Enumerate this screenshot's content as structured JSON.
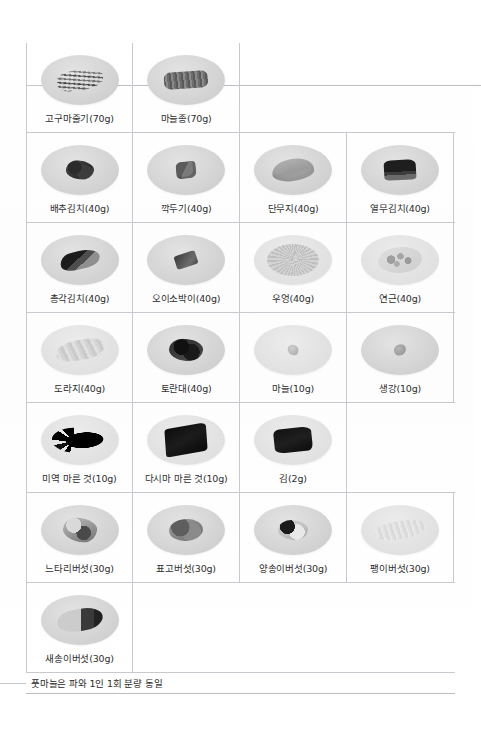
{
  "document": {
    "type": "scanned-reference-table",
    "title_visible": false,
    "footnote": "풋마늘은 파와 1인 1회 분량 동일"
  },
  "table": {
    "columns": 4,
    "rows": [
      {
        "index": 0,
        "cells": [
          {
            "label": "고구마줄기(70g)",
            "food": "sweet-potato-stem",
            "shape": "f-stems",
            "plate": "plate"
          },
          {
            "label": "마늘종(70g)",
            "food": "garlic-scape",
            "shape": "f-bundle",
            "plate": "plate"
          },
          {
            "label": "",
            "food": "",
            "shape": "",
            "plate": ""
          },
          {
            "label": "",
            "food": "",
            "shape": "",
            "plate": ""
          }
        ]
      },
      {
        "index": 1,
        "cells": [
          {
            "label": "배추김치(40g)",
            "food": "napa-cabbage-kimchi",
            "shape": "f-kimchi",
            "plate": "plate"
          },
          {
            "label": "깍두기(40g)",
            "food": "radish-cube-kimchi",
            "shape": "f-cubes",
            "plate": "plate"
          },
          {
            "label": "단무지(40g)",
            "food": "pickled-radish",
            "shape": "f-slab",
            "plate": "plate"
          },
          {
            "label": "열무김치(40g)",
            "food": "young-radish-kimchi",
            "shape": "f-dark-stack",
            "plate": "plate"
          }
        ]
      },
      {
        "index": 2,
        "cells": [
          {
            "label": "총각김치(40g)",
            "food": "ponytail-radish-kimchi",
            "shape": "f-radish-kimchi",
            "plate": "plate"
          },
          {
            "label": "오이소박이(40g)",
            "food": "stuffed-cucumber-kimchi",
            "shape": "f-chunk",
            "plate": "plate"
          },
          {
            "label": "우엉(40g)",
            "food": "burdock-root",
            "shape": "f-noodly",
            "plate": "plate pale"
          },
          {
            "label": "연근(40g)",
            "food": "lotus-root",
            "shape": "f-lotus",
            "plate": "plate pale"
          }
        ]
      },
      {
        "index": 3,
        "cells": [
          {
            "label": "도라지(40g)",
            "food": "bellflower-root",
            "shape": "f-roots",
            "plate": "plate pale"
          },
          {
            "label": "토란대(40g)",
            "food": "taro-stem",
            "shape": "f-taro",
            "plate": "plate"
          },
          {
            "label": "마늘(10g)",
            "food": "garlic",
            "shape": "f-tiny",
            "plate": "plate pale"
          },
          {
            "label": "생강(10g)",
            "food": "ginger",
            "shape": "f-tiny-dark",
            "plate": "plate"
          }
        ]
      },
      {
        "index": 4,
        "cells": [
          {
            "label": "미역 마른 것(10g)",
            "food": "dried-sea-mustard",
            "shape": "f-seaweed-dry",
            "plate": "plate pale"
          },
          {
            "label": "다시마 마른 것(10g)",
            "food": "dried-kelp",
            "shape": "f-kelp",
            "plate": "plate pale"
          },
          {
            "label": "김(2g)",
            "food": "laver",
            "shape": "f-gim",
            "plate": "plate pale"
          },
          {
            "label": "",
            "food": "",
            "shape": "",
            "plate": ""
          }
        ]
      },
      {
        "index": 5,
        "cells": [
          {
            "label": "느타리버섯(30g)",
            "food": "oyster-mushroom",
            "shape": "f-oyster-mush",
            "plate": "plate"
          },
          {
            "label": "표고버섯(30g)",
            "food": "shiitake-mushroom",
            "shape": "f-shiitake",
            "plate": "plate"
          },
          {
            "label": "양송이버섯(30g)",
            "food": "button-mushroom",
            "shape": "f-button-mush",
            "plate": "plate"
          },
          {
            "label": "팽이버섯(30g)",
            "food": "enoki-mushroom",
            "shape": "f-enoki",
            "plate": "plate pale"
          }
        ]
      },
      {
        "index": 6,
        "cells": [
          {
            "label": "새송이버섯(30g)",
            "food": "king-oyster-mushroom",
            "shape": "f-king-oyster",
            "plate": "plate"
          },
          {
            "label": "",
            "food": "",
            "shape": "",
            "plate": ""
          },
          {
            "label": "",
            "food": "",
            "shape": "",
            "plate": ""
          },
          {
            "label": "",
            "food": "",
            "shape": "",
            "plate": ""
          }
        ]
      }
    ]
  },
  "colors": {
    "rule": "#c6c9cd",
    "rule_strong": "#b9bcc0",
    "text": "#2e2e2e",
    "plate": "#d6d6d6",
    "page": "#ffffff"
  }
}
